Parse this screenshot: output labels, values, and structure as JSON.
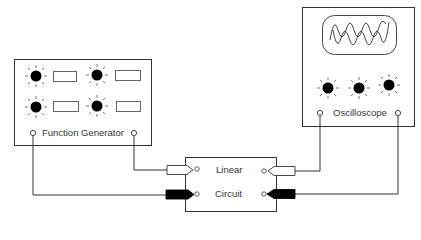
{
  "diagram": {
    "function_generator": {
      "label": "Function Generator",
      "knobs": 4,
      "displays": 4
    },
    "oscilloscope": {
      "label": "Oscilloscope",
      "knobs": 3,
      "screen": "two-waveforms"
    },
    "linear_circuit": {
      "label_line1": "Linear",
      "label_line2": "Circuit"
    },
    "connections": [
      {
        "from": "function-generator-left-terminal",
        "to": "linear-circuit-input-lower",
        "connector": "black"
      },
      {
        "from": "function-generator-right-terminal",
        "to": "linear-circuit-input-upper",
        "connector": "white"
      },
      {
        "from": "oscilloscope-left-terminal",
        "to": "linear-circuit-output-upper",
        "connector": "white"
      },
      {
        "from": "oscilloscope-right-terminal",
        "to": "linear-circuit-output-lower",
        "connector": "black"
      }
    ]
  }
}
